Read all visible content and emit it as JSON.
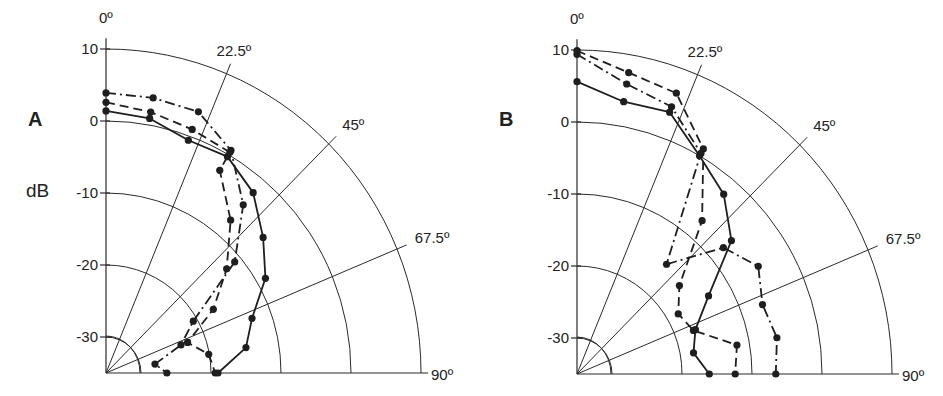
{
  "chart_data": [
    {
      "panel": "A",
      "type": "polar-line",
      "unit_label": "dB",
      "angle_axis": {
        "labels": [
          "0º",
          "22.5º",
          "45º",
          "67.5º",
          "90º"
        ],
        "angles": [
          0,
          22.5,
          45,
          67.5,
          90
        ]
      },
      "radial_axis": {
        "tick_labels": [
          "10",
          "0",
          "-10",
          "-20",
          "-30"
        ],
        "ticks": [
          10,
          0,
          -10,
          -20,
          -30
        ],
        "range": [
          -35,
          10
        ]
      },
      "grid": true,
      "series": [
        {
          "name": "dash-dot",
          "style": "dash-dot",
          "angles": [
            0,
            10,
            20,
            30,
            40,
            50,
            60,
            70,
            80,
            90
          ],
          "values": [
            3.9,
            3.8,
            3.6,
            0.7,
            -4.5,
            -11.0,
            -20.6,
            -23.6,
            -27.9,
            -26.3
          ]
        },
        {
          "name": "dashed",
          "style": "dashed",
          "angles": [
            0,
            10,
            20,
            30,
            30,
            40,
            50,
            60,
            70,
            80,
            90
          ],
          "values": [
            2.6,
            1.8,
            1.0,
            0.4,
            -2.5,
            -7.3,
            -12.5,
            -17.3,
            -22.6,
            -20.1,
            -19.4
          ]
        },
        {
          "name": "solid",
          "style": "solid",
          "angles": [
            0,
            10,
            20,
            30,
            40,
            50,
            60,
            70,
            80,
            90
          ],
          "values": [
            1.4,
            0.9,
            -0.6,
            -0.3,
            -2.3,
            -5.7,
            -8.7,
            -12.8,
            -14.7,
            -19.0
          ]
        }
      ]
    },
    {
      "panel": "B",
      "type": "polar-line",
      "unit_label": "",
      "angle_axis": {
        "labels": [
          "0º",
          "22.5º",
          "45º",
          "67.5º",
          "90º"
        ],
        "angles": [
          0,
          22.5,
          45,
          67.5,
          90
        ]
      },
      "radial_axis": {
        "tick_labels": [
          "10",
          "0",
          "-10",
          "-20",
          "-30"
        ],
        "ticks": [
          10,
          0,
          -10,
          -20,
          -30
        ],
        "range": [
          -35,
          10
        ]
      },
      "grid": true,
      "series": [
        {
          "name": "dashed",
          "style": "dashed",
          "angles": [
            0,
            10,
            20,
            30,
            40,
            50,
            60,
            70,
            80,
            90
          ],
          "values": [
            9.9,
            7.5,
            6.5,
            1.1,
            -7.2,
            -15.9,
            -18.3,
            -17.3,
            -11.8,
            -12.4
          ]
        },
        {
          "name": "dash-dot",
          "style": "dash-dot",
          "angles": [
            0,
            10,
            20,
            30,
            40,
            50,
            60,
            70,
            80,
            90
          ],
          "values": [
            9.4,
            5.9,
            4.5,
            0.4,
            -15.1,
            -7.7,
            -5.1,
            -6.8,
            -6.0,
            -6.6
          ]
        },
        {
          "name": "solid",
          "style": "solid",
          "angles": [
            0,
            10,
            20,
            30,
            40,
            50,
            60,
            70,
            80,
            90
          ],
          "values": [
            5.6,
            3.4,
            3.7,
            0.0,
            -2.4,
            -6.2,
            -13.3,
            -17.0,
            -18.1,
            -16.1
          ]
        }
      ]
    }
  ],
  "panels": [
    {
      "label": "A",
      "unit": "dB",
      "origin": [
        106,
        373
      ]
    },
    {
      "label": "B",
      "unit": "",
      "origin": [
        577,
        374
      ]
    }
  ],
  "style": {
    "line_color": "#1e1e1e",
    "grid_color": "#2a2a2a",
    "background": "#ffffff"
  }
}
